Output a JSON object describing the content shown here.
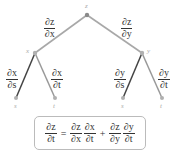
{
  "nodes": {
    "z": "z",
    "x": "x",
    "y": "y",
    "s_left": "s",
    "t_left": "t",
    "s_right": "s",
    "t_right": "t"
  },
  "edges": {
    "z_x": {
      "num": "∂z",
      "den": "∂x"
    },
    "z_y": {
      "num": "∂z",
      "den": "∂y"
    },
    "x_s": {
      "num": "∂x",
      "den": "∂s"
    },
    "x_t": {
      "num": "∂x",
      "den": "∂t"
    },
    "y_s": {
      "num": "∂y",
      "den": "∂s"
    },
    "y_t": {
      "num": "∂y",
      "den": "∂t"
    }
  },
  "formula": {
    "lhs": {
      "num": "∂z",
      "den": "∂t"
    },
    "eq": "=",
    "term1a": {
      "num": "∂z",
      "den": "∂x"
    },
    "term1b": {
      "num": "∂x",
      "den": "∂t"
    },
    "plus": "+",
    "term2a": {
      "num": "∂z",
      "den": "∂y"
    },
    "term2b": {
      "num": "∂y",
      "den": "∂t"
    }
  },
  "colors": {
    "upper_edges": "#a8a8a8",
    "lower_edges_dark": "#444444",
    "lower_edges_light": "#999999",
    "node_dot": "#9a9a9a"
  }
}
